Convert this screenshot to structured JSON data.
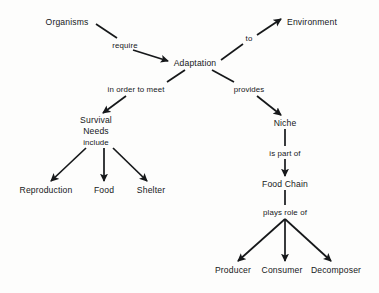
{
  "diagram": {
    "background_color": "#fdfdfc",
    "ink_color": "#16181a",
    "nodes": [
      {
        "id": "organisms",
        "label": "Organisms",
        "x": 67,
        "y": 22
      },
      {
        "id": "adaptation",
        "label": "Adaptation",
        "x": 195,
        "y": 63
      },
      {
        "id": "environment",
        "label": "Environment",
        "x": 312,
        "y": 22
      },
      {
        "id": "survival",
        "label": "Survival",
        "x": 96,
        "y": 120
      },
      {
        "id": "needs",
        "label": "Needs",
        "x": 96,
        "y": 131
      },
      {
        "id": "reproduction",
        "label": "Reproduction",
        "x": 46,
        "y": 190
      },
      {
        "id": "food",
        "label": "Food",
        "x": 104,
        "y": 190
      },
      {
        "id": "shelter",
        "label": "Shelter",
        "x": 151,
        "y": 190
      },
      {
        "id": "niche",
        "label": "Niche",
        "x": 285,
        "y": 123
      },
      {
        "id": "foodchain",
        "label": "Food Chain",
        "x": 285,
        "y": 184
      },
      {
        "id": "producer",
        "label": "Producer",
        "x": 233,
        "y": 270
      },
      {
        "id": "consumer",
        "label": "Consumer",
        "x": 282,
        "y": 270
      },
      {
        "id": "decomposer",
        "label": "Decomposer",
        "x": 336,
        "y": 270
      }
    ],
    "link_labels": [
      {
        "id": "require",
        "label": "require",
        "x": 125,
        "y": 45
      },
      {
        "id": "to",
        "label": "to",
        "x": 249,
        "y": 38
      },
      {
        "id": "in-order-to-meet",
        "label": "in order to meet",
        "x": 136,
        "y": 89
      },
      {
        "id": "provides",
        "label": "provides",
        "x": 249,
        "y": 89
      },
      {
        "id": "include",
        "label": "include",
        "x": 96,
        "y": 142
      },
      {
        "id": "is-part-of",
        "label": "is part of",
        "x": 285,
        "y": 153
      },
      {
        "id": "plays-role-of",
        "label": "plays role of",
        "x": 285,
        "y": 212
      }
    ],
    "edges": [
      {
        "id": "organisms-to-adaptation-1",
        "from": "organisms",
        "to": "require",
        "x1": 96,
        "y1": 24,
        "x2": 117,
        "y2": 38,
        "arrow": false
      },
      {
        "id": "organisms-to-adaptation-2",
        "from": "require",
        "to": "adaptation",
        "x1": 133,
        "y1": 50,
        "x2": 168,
        "y2": 61,
        "arrow": true
      },
      {
        "id": "adaptation-to-environment-1",
        "from": "adaptation",
        "to": "to",
        "x1": 221,
        "y1": 60,
        "x2": 243,
        "y2": 44,
        "arrow": false
      },
      {
        "id": "adaptation-to-environment-2",
        "from": "to",
        "to": "environment",
        "x1": 257,
        "y1": 35,
        "x2": 281,
        "y2": 19,
        "arrow": true
      },
      {
        "id": "adaptation-to-survival-1",
        "from": "adaptation",
        "to": "meet",
        "x1": 185,
        "y1": 70,
        "x2": 167,
        "y2": 82,
        "arrow": false
      },
      {
        "id": "adaptation-to-survival-2",
        "from": "meet",
        "to": "survival",
        "x1": 126,
        "y1": 96,
        "x2": 103,
        "y2": 113,
        "arrow": true
      },
      {
        "id": "adaptation-to-niche-1",
        "from": "adaptation",
        "to": "provides",
        "x1": 212,
        "y1": 70,
        "x2": 234,
        "y2": 82,
        "arrow": false
      },
      {
        "id": "adaptation-to-niche-2",
        "from": "provides",
        "to": "niche",
        "x1": 257,
        "y1": 96,
        "x2": 281,
        "y2": 115,
        "arrow": true
      },
      {
        "id": "needs-to-reproduction",
        "from": "needs",
        "to": "reproduction",
        "x1": 86,
        "y1": 148,
        "x2": 51,
        "y2": 181,
        "arrow": true
      },
      {
        "id": "needs-to-food",
        "from": "needs",
        "to": "food",
        "x1": 104,
        "y1": 148,
        "x2": 104,
        "y2": 181,
        "arrow": true
      },
      {
        "id": "needs-to-shelter",
        "from": "needs",
        "to": "shelter",
        "x1": 113,
        "y1": 148,
        "x2": 147,
        "y2": 181,
        "arrow": true
      },
      {
        "id": "niche-to-ispartof",
        "from": "niche",
        "to": "is part of",
        "x1": 285,
        "y1": 129,
        "x2": 285,
        "y2": 146,
        "arrow": false
      },
      {
        "id": "ispartof-to-foodchain",
        "from": "is part of",
        "to": "foodchain",
        "x1": 285,
        "y1": 159,
        "x2": 285,
        "y2": 176,
        "arrow": true
      },
      {
        "id": "foodchain-to-playsrole",
        "from": "foodchain",
        "to": "plays role of",
        "x1": 285,
        "y1": 190,
        "x2": 285,
        "y2": 205,
        "arrow": false
      },
      {
        "id": "playsrole-to-producer",
        "from": "plays role of",
        "to": "producer",
        "x1": 285,
        "y1": 219,
        "x2": 238,
        "y2": 261,
        "arrow": true
      },
      {
        "id": "playsrole-to-consumer",
        "from": "plays role of",
        "to": "consumer",
        "x1": 285,
        "y1": 219,
        "x2": 285,
        "y2": 261,
        "arrow": true
      },
      {
        "id": "playsrole-to-decomposer",
        "from": "plays role of",
        "to": "decomposer",
        "x1": 285,
        "y1": 219,
        "x2": 331,
        "y2": 261,
        "arrow": true
      }
    ]
  }
}
